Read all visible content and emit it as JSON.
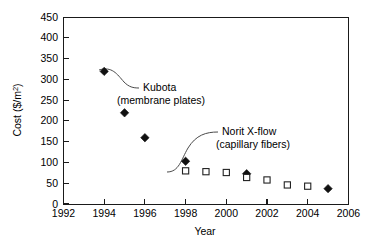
{
  "chart_data": {
    "type": "scatter",
    "title": "",
    "xlabel": "Year",
    "ylabel": "Cost ($/m2)",
    "ylabel_display": "Cost ($/m",
    "ylabel_exponent": "2",
    "ylabel_tail": ")",
    "xlim": [
      1992,
      2006
    ],
    "ylim": [
      0,
      450
    ],
    "xticks": [
      1992,
      1994,
      1996,
      1998,
      2000,
      2002,
      2004,
      2006
    ],
    "yticks": [
      0,
      50,
      100,
      150,
      200,
      250,
      300,
      350,
      400,
      450
    ],
    "xtick_labels": [
      "1992",
      "1994",
      "1996",
      "1998",
      "2000",
      "2002",
      "2004",
      "2006"
    ],
    "ytick_labels": [
      "0",
      "50",
      "100",
      "150",
      "200",
      "250",
      "300",
      "350",
      "400",
      "450"
    ],
    "grid": false,
    "legend": "none",
    "series": [
      {
        "name": "Kubota (membrane plates)",
        "marker": "filled-diamond",
        "color": "#111111",
        "x": [
          1994,
          1995,
          1996,
          1998,
          2001,
          2005
        ],
        "values": [
          320,
          220,
          160,
          103,
          73,
          37
        ]
      },
      {
        "name": "Norit X-flow (capillary fibers)",
        "marker": "open-square",
        "color": "#222222",
        "x": [
          1998,
          1999,
          2000,
          2001,
          2002,
          2003,
          2004
        ],
        "values": [
          80,
          78,
          76,
          64,
          58,
          46,
          43
        ]
      }
    ],
    "annotations": [
      {
        "id": "kubota",
        "line1": "Kubota",
        "line2": "(membrane plates)",
        "points_to_year": 1994,
        "points_to_value": 320
      },
      {
        "id": "norit",
        "line1": "Norit X-flow",
        "line2": "(capillary fibers)",
        "points_to_year": 1998,
        "points_to_value": 80
      }
    ]
  }
}
